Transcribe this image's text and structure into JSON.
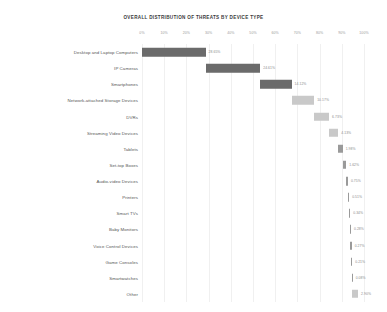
{
  "chart_data": {
    "type": "bar",
    "subtype": "waterfall-cascade",
    "title": "OVERALL DISTRIBUTION OF THREATS BY DEVICE TYPE",
    "xlabel": "",
    "ylabel": "",
    "xlim": [
      0,
      100
    ],
    "grid": true,
    "legend": "none",
    "orientation": "horizontal",
    "tick_labels": [
      "0%",
      "10%",
      "20%",
      "30%",
      "40%",
      "50%",
      "60%",
      "70%",
      "80%",
      "90%",
      "100%"
    ],
    "tick_values": [
      0,
      10,
      20,
      30,
      40,
      50,
      60,
      70,
      80,
      90,
      100
    ],
    "categories": [
      "Desktop and Laptop Computers",
      "IP Cameras",
      "Smartphones",
      "Network-attached Storage Devices",
      "DVRs",
      "Streaming Video Devices",
      "Tablets",
      "Set-top Boxes",
      "Audio-video Devices",
      "Printers",
      "Smart TVs",
      "Baby Monitors",
      "Voice Control Devices",
      "Game Consoles",
      "Smartwatches",
      "Other"
    ],
    "values": [
      28.65,
      24.61,
      14.12,
      10.17,
      6.73,
      4.13,
      1.98,
      1.62,
      0.75,
      0.51,
      0.34,
      0.28,
      0.27,
      0.21,
      0.08,
      2.9
    ],
    "value_labels": [
      "28.65%",
      "24.61%",
      "14.12%",
      "10.17%",
      "6.73%",
      "4.13%",
      "1.98%",
      "1.62%",
      "0.75%",
      "0.51%",
      "0.34%",
      "0.28%",
      "0.27%",
      "0.21%",
      "0.08%",
      "2.90%"
    ],
    "starts": [
      0,
      28.65,
      53.26,
      67.38,
      77.55,
      84.28,
      88.41,
      90.39,
      92.01,
      92.76,
      93.27,
      93.61,
      93.89,
      94.16,
      94.37,
      94.45
    ],
    "bar_colors": [
      "#6b6b6b",
      "#6b6b6b",
      "#6b6b6b",
      "#c9c9c9",
      "#c9c9c9",
      "#c9c9c9",
      "#9a9a9a",
      "#9a9a9a",
      "#9a9a9a",
      "#9a9a9a",
      "#9a9a9a",
      "#9a9a9a",
      "#9a9a9a",
      "#9a9a9a",
      "#9a9a9a",
      "#c9c9c9"
    ],
    "colors": {
      "dark_bar": "#6b6b6b",
      "mid_bar": "#9a9a9a",
      "light_bar": "#c9c9c9",
      "gridline": "#f0f0f0",
      "tick_text": "#9a9a9a",
      "category_text": "#555555",
      "value_text": "#8c8c8c",
      "title_text": "#3a3a3a",
      "background": "#ffffff"
    }
  }
}
